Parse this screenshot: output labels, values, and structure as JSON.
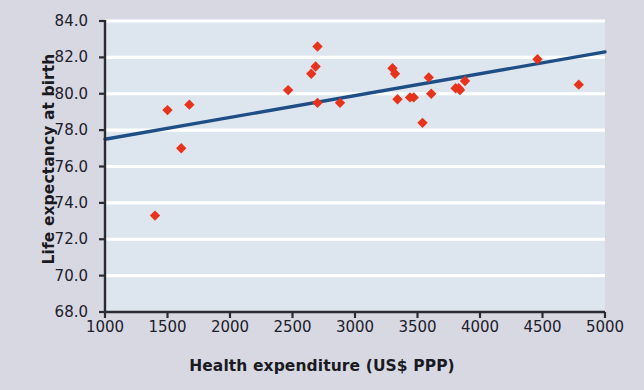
{
  "chart_data": {
    "type": "scatter",
    "title": "",
    "xlabel": "Health expenditure (US$ PPP)",
    "ylabel": "Life expectancy at birth",
    "xlim": [
      1000,
      5000
    ],
    "ylim": [
      68.0,
      84.0
    ],
    "xticks": [
      "1000",
      "1500",
      "2000",
      "2500",
      "3000",
      "3500",
      "4000",
      "4500",
      "5000"
    ],
    "yticks": [
      "84.0",
      "82.0",
      "80.0",
      "78.0",
      "76.0",
      "74.0",
      "72.0",
      "70.0",
      "68.0"
    ],
    "xtick_values": [
      1000,
      1500,
      2000,
      2500,
      3000,
      3500,
      4000,
      4500,
      5000
    ],
    "ytick_values": [
      84.0,
      82.0,
      80.0,
      78.0,
      76.0,
      74.0,
      72.0,
      70.0,
      68.0
    ],
    "grid": "horizontal",
    "legend": "none",
    "marker": "diamond",
    "marker_color": "#e8331c",
    "plot_background": "#dde6ee",
    "figure_background": "#d8d8e2",
    "gridline_color": "#ffffff",
    "axis_color": "#2b2b33",
    "points": [
      {
        "x": 1400,
        "y": 73.3
      },
      {
        "x": 1500,
        "y": 79.1
      },
      {
        "x": 1610,
        "y": 77.0
      },
      {
        "x": 1675,
        "y": 79.4
      },
      {
        "x": 2465,
        "y": 80.2
      },
      {
        "x": 2650,
        "y": 81.1
      },
      {
        "x": 2685,
        "y": 81.5
      },
      {
        "x": 2700,
        "y": 82.6
      },
      {
        "x": 2700,
        "y": 79.5
      },
      {
        "x": 2880,
        "y": 79.5
      },
      {
        "x": 3300,
        "y": 81.4
      },
      {
        "x": 3320,
        "y": 81.1
      },
      {
        "x": 3340,
        "y": 79.7
      },
      {
        "x": 3440,
        "y": 79.8
      },
      {
        "x": 3470,
        "y": 79.8
      },
      {
        "x": 3540,
        "y": 78.4
      },
      {
        "x": 3590,
        "y": 80.9
      },
      {
        "x": 3610,
        "y": 80.0
      },
      {
        "x": 3805,
        "y": 80.3
      },
      {
        "x": 3830,
        "y": 80.3
      },
      {
        "x": 3840,
        "y": 80.2
      },
      {
        "x": 3880,
        "y": 80.7
      },
      {
        "x": 4460,
        "y": 81.9
      },
      {
        "x": 4790,
        "y": 80.5
      }
    ],
    "trendline": {
      "color": "#1f4e87",
      "x_start": 1000,
      "y_start": 77.5,
      "x_end": 5000,
      "y_end": 82.3
    }
  }
}
